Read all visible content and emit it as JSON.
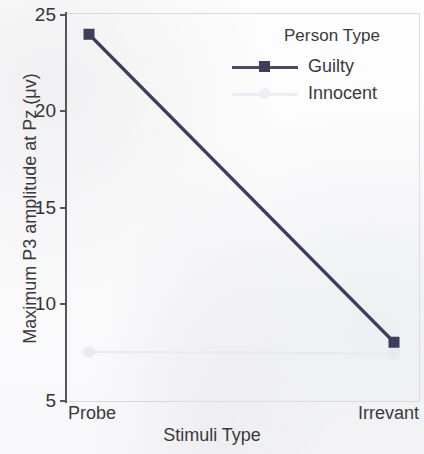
{
  "chart_data": {
    "type": "line",
    "title": "",
    "xlabel": "Stimuli Type",
    "ylabel": "Maximum P3 amplitude at Pz (μv)",
    "categories": [
      "Probe",
      "Irrevant"
    ],
    "ylim": [
      5,
      25
    ],
    "yticks": [
      5,
      10,
      15,
      20,
      25
    ],
    "ytick_labels": [
      "5",
      "10",
      "15",
      "20",
      "25"
    ],
    "grid": false,
    "legend_position": "top-right",
    "legend_title": "Person Type",
    "series": [
      {
        "name": "Guilty",
        "values": [
          24,
          8
        ],
        "color": "#3d3d5c",
        "marker": "square",
        "visible": true
      },
      {
        "name": "Innocent",
        "values": [
          7.5,
          7.4
        ],
        "color": "#e8e9ef",
        "marker": "circle",
        "visible": true
      }
    ]
  },
  "axes": {
    "y_title": "Maximum P3 amplitude at Pz (μv)",
    "x_title": "Stimuli Type",
    "y_tick_labels": [
      "25",
      "20",
      "15",
      "10",
      "5"
    ],
    "x_tick_labels": [
      "Probe",
      "Irrevant"
    ]
  },
  "legend": {
    "title": "Person Type",
    "entries": [
      {
        "label": "Guilty"
      },
      {
        "label": "Innocent"
      }
    ]
  },
  "colors": {
    "guilty_line": "#3d3d5c",
    "innocent_line": "#e8e9ef",
    "axis": "#55555f",
    "frame": "#d9d9de",
    "text": "#3a3a3a",
    "background": "#fdfdfd"
  }
}
